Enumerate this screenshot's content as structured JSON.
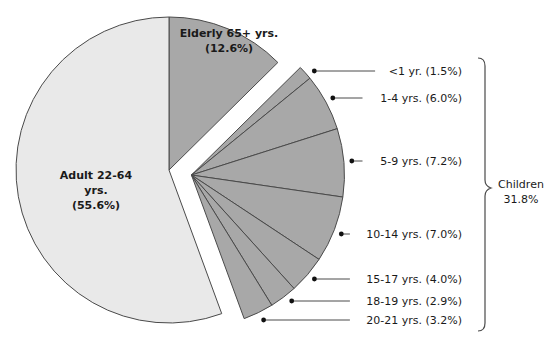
{
  "chart_data": {
    "type": "pie",
    "title": "",
    "exploded_group": "Children",
    "slices": [
      {
        "label": "Elderly 65+ yrs.",
        "value": 12.6,
        "display": "(12.6%)",
        "group": null
      },
      {
        "label": "<1 yr.",
        "value": 1.5,
        "display": "(1.5%)",
        "group": "Children"
      },
      {
        "label": "1-4 yrs.",
        "value": 6.0,
        "display": "(6.0%)",
        "group": "Children"
      },
      {
        "label": "5-9 yrs.",
        "value": 7.2,
        "display": "(7.2%)",
        "group": "Children"
      },
      {
        "label": "10-14 yrs.",
        "value": 7.0,
        "display": "(7.0%)",
        "group": "Children"
      },
      {
        "label": "15-17 yrs.",
        "value": 4.0,
        "display": "(4.0%)",
        "group": "Children"
      },
      {
        "label": "18-19 yrs.",
        "value": 2.9,
        "display": "(2.9%)",
        "group": "Children"
      },
      {
        "label": "20-21 yrs.",
        "value": 3.2,
        "display": "(3.2%)",
        "group": "Children"
      },
      {
        "label": "Adult 22-64 yrs.",
        "value": 55.6,
        "display": "(55.6%)",
        "group": null
      }
    ],
    "groups": [
      {
        "name": "Children",
        "total": 31.8,
        "display": "31.8%"
      }
    ],
    "legend": "none (leader-line labels)"
  },
  "labels": {
    "elderly_line1": "Elderly 65+ yrs.",
    "elderly_line2": "(12.6%)",
    "adult_line1": "Adult 22-64",
    "adult_line2": "yrs.",
    "adult_line3": "(55.6%)",
    "children_line1": "Children",
    "children_line2": "31.8%",
    "child_callouts": [
      "<1 yr. (1.5%)",
      "1-4 yrs. (6.0%)",
      "5-9 yrs. (7.2%)",
      "10-14 yrs. (7.0%)",
      "15-17 yrs. (4.0%)",
      "18-19 yrs. (2.9%)",
      "20-21 yrs. (3.2%)"
    ]
  },
  "colors": {
    "adult_fill": "#e9e9e9",
    "elderly_fill": "#a8a8a8",
    "children_fill": "#a8a8a8",
    "stroke": "#4a4a4a",
    "text": "#1a1a1a"
  }
}
